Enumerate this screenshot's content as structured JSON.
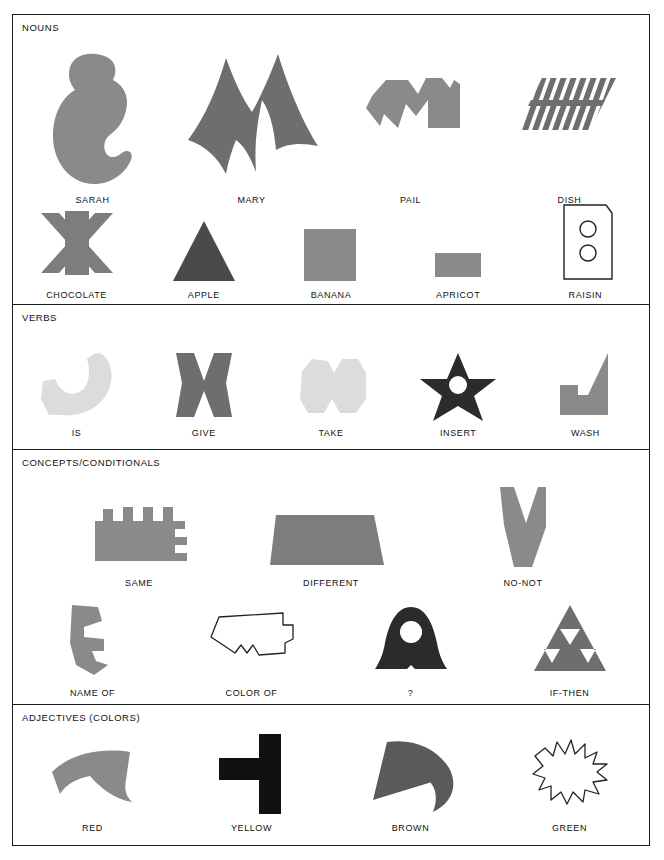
{
  "page": {
    "background": "#ffffff",
    "border_color": "#1a1a1a"
  },
  "palette": {
    "mid_gray": "#8a8a8a",
    "dark_gray": "#5a5a5a",
    "light_gray": "#dcdcdc",
    "near_black": "#2b2b2b",
    "black": "#111111",
    "white": "#ffffff"
  },
  "sections": [
    {
      "id": "nouns",
      "title": "NOUNS",
      "rows": [
        {
          "items": [
            {
              "label": "SARAH",
              "icon": "sarah-blob-shape",
              "color": "#8a8a8a"
            },
            {
              "label": "MARY",
              "icon": "mary-m-spike-shape",
              "color": "#6e6e6e"
            },
            {
              "label": "PAIL",
              "icon": "pail-zigzag-shape",
              "color": "#8a8a8a"
            },
            {
              "label": "DISH",
              "icon": "dish-striped-parallelogram-shape",
              "color": "#6e6e6e"
            }
          ]
        },
        {
          "items": [
            {
              "label": "CHOCOLATE",
              "icon": "chocolate-asterisk-shape",
              "color": "#7d7d7d"
            },
            {
              "label": "APPLE",
              "icon": "apple-triangle-shape",
              "color": "#4a4a4a"
            },
            {
              "label": "BANANA",
              "icon": "banana-square-shape",
              "color": "#8a8a8a"
            },
            {
              "label": "APRICOT",
              "icon": "apricot-rectangle-shape",
              "color": "#8a8a8a"
            },
            {
              "label": "RAISIN",
              "icon": "raisin-outlined-box-shape",
              "color": "#ffffff"
            }
          ]
        }
      ]
    },
    {
      "id": "verbs",
      "title": "VERBS",
      "rows": [
        {
          "items": [
            {
              "label": "IS",
              "icon": "is-leaf-hook-shape",
              "color": "#dcdcdc"
            },
            {
              "label": "GIVE",
              "icon": "give-bowtie-shape",
              "color": "#6e6e6e"
            },
            {
              "label": "TAKE",
              "icon": "take-double-hex-shape",
              "color": "#dcdcdc"
            },
            {
              "label": "INSERT",
              "icon": "insert-star-hole-shape",
              "color": "#2b2b2b"
            },
            {
              "label": "WASH",
              "icon": "wash-notched-triangle-shape",
              "color": "#8a8a8a"
            }
          ]
        }
      ]
    },
    {
      "id": "concepts",
      "title": "CONCEPTS/CONDITIONALS",
      "rows": [
        {
          "items": [
            {
              "label": "SAME",
              "icon": "same-comb-shape",
              "color": "#8a8a8a"
            },
            {
              "label": "DIFFERENT",
              "icon": "different-trapezoid-shape",
              "color": "#7d7d7d"
            },
            {
              "label": "NO-NOT",
              "icon": "no-not-v-wedge-shape",
              "color": "#8a8a8a"
            }
          ]
        },
        {
          "items": [
            {
              "label": "NAME OF",
              "icon": "name-of-arrow-notch-shape",
              "color": "#8a8a8a"
            },
            {
              "label": "COLOR OF",
              "icon": "color-of-outlined-polygon-shape",
              "color": "#ffffff"
            },
            {
              "label": "?",
              "icon": "question-bell-hole-shape",
              "color": "#2b2b2b"
            },
            {
              "label": "IF-THEN",
              "icon": "if-then-sierpinski-triangle-shape",
              "color": "#6e6e6e"
            }
          ]
        }
      ]
    },
    {
      "id": "adjectives",
      "title": "ADJECTIVES (COLORS)",
      "rows": [
        {
          "items": [
            {
              "label": "RED",
              "icon": "red-curved-band-shape",
              "color": "#8a8a8a"
            },
            {
              "label": "YELLOW",
              "icon": "yellow-t-cross-shape",
              "color": "#111111"
            },
            {
              "label": "BROWN",
              "icon": "brown-arrow-head-shape",
              "color": "#5a5a5a"
            },
            {
              "label": "GREEN",
              "icon": "green-outlined-starburst-shape",
              "color": "#ffffff"
            }
          ]
        }
      ]
    }
  ]
}
